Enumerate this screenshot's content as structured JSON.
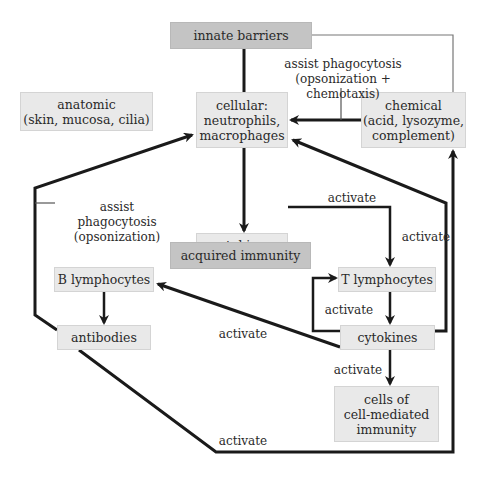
{
  "diagram": {
    "nodes": {
      "innate_barriers": "innate barriers",
      "anatomic": "anatomic\n(skin, mucosa, cilia)",
      "cellular": "cellular:\nneutrophils,\nmacrophages",
      "chemical": "chemical\n(acid, lysozyme,\ncomplement)",
      "cytokines_innate": "cytokines",
      "acquired_immunity": "acquired immunity",
      "b_lymphocytes": "B lymphocytes",
      "t_lymphocytes": "T lymphocytes",
      "antibodies": "antibodies",
      "cytokines_acquired": "cytokines",
      "cell_mediated": "cells of\ncell-mediated\nimmunity"
    },
    "edge_labels": {
      "chemical_to_cellular": "assist phagocytosis\n(opsonization + chemotaxis)",
      "antibodies_to_cellular": "assist phagocytosis\n(opsonization)",
      "cytokines_to_t_top": "activate",
      "cytokines_to_t_side": "activate",
      "loop_cytokines_to_t": "activate",
      "cytokines_to_b": "activate",
      "cytokines_to_cells": "activate",
      "antibodies_to_chemical": "activate"
    },
    "colors": {
      "box_fill": "#e9e9e9",
      "header_fill": "#c4c4c4",
      "line": "#1a1a1a",
      "thin_line": "#555555"
    }
  }
}
